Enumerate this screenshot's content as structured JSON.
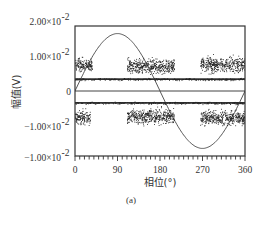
{
  "chart_data": {
    "type": "scatter",
    "title": "",
    "caption": "(a)",
    "xlabel": "相位(°)",
    "ylabel": "幅值(V)",
    "xlim": [
      0,
      360
    ],
    "ylim": [
      -0.0186,
      0.0186
    ],
    "grid": false,
    "x_ticks": [
      {
        "value": 0,
        "label": "0"
      },
      {
        "value": 90,
        "label": "90"
      },
      {
        "value": 180,
        "label": "180"
      },
      {
        "value": 270,
        "label": "270"
      },
      {
        "value": 360,
        "label": "360"
      }
    ],
    "x_minor_tick_step": 10,
    "y_ticks": [
      {
        "value": 0.02,
        "label": "2.00×10",
        "exp": "-2"
      },
      {
        "value": 0.01,
        "label": "1.00×10",
        "exp": "-2"
      },
      {
        "value": 0,
        "label": "0",
        "exp": ""
      },
      {
        "value": -0.01,
        "label": "−1.00×10",
        "exp": "-2"
      },
      {
        "value": -0.019,
        "label": "−1.00×10",
        "exp": "-2"
      }
    ],
    "series": [
      {
        "name": "reference-sine",
        "kind": "line",
        "amplitude": 0.0164,
        "period_deg": 360,
        "phase_deg": 0
      },
      {
        "name": "zero-line",
        "kind": "hline",
        "value": 0.0
      },
      {
        "name": "upper-noise-band",
        "kind": "band",
        "value": 0.0034,
        "spread": 0.0003
      },
      {
        "name": "lower-noise-band",
        "kind": "band",
        "value": -0.0034,
        "spread": 0.0003
      },
      {
        "name": "positive-discharge-clusters",
        "kind": "scatter-clusters",
        "clusters": [
          {
            "x_range": [
              0,
              36
            ],
            "center": 0.0075,
            "spread": 0.0018
          },
          {
            "x_range": [
              110,
              210
            ],
            "center": 0.0072,
            "spread": 0.002
          },
          {
            "x_range": [
              265,
              360
            ],
            "center": 0.0076,
            "spread": 0.002
          }
        ]
      },
      {
        "name": "negative-discharge-clusters",
        "kind": "scatter-clusters",
        "clusters": [
          {
            "x_range": [
              0,
              32
            ],
            "center": -0.0075,
            "spread": 0.0018
          },
          {
            "x_range": [
              110,
              210
            ],
            "center": -0.0072,
            "spread": 0.002
          },
          {
            "x_range": [
              265,
              360
            ],
            "center": -0.0076,
            "spread": 0.002
          }
        ]
      }
    ]
  }
}
